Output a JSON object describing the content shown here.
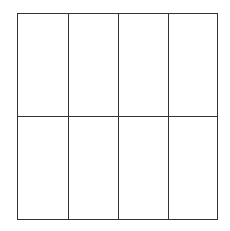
{
  "diagram": {
    "type": "grid",
    "rows": 2,
    "columns": 4,
    "cells": 8,
    "line_color": "#333333",
    "background": "#ffffff"
  }
}
